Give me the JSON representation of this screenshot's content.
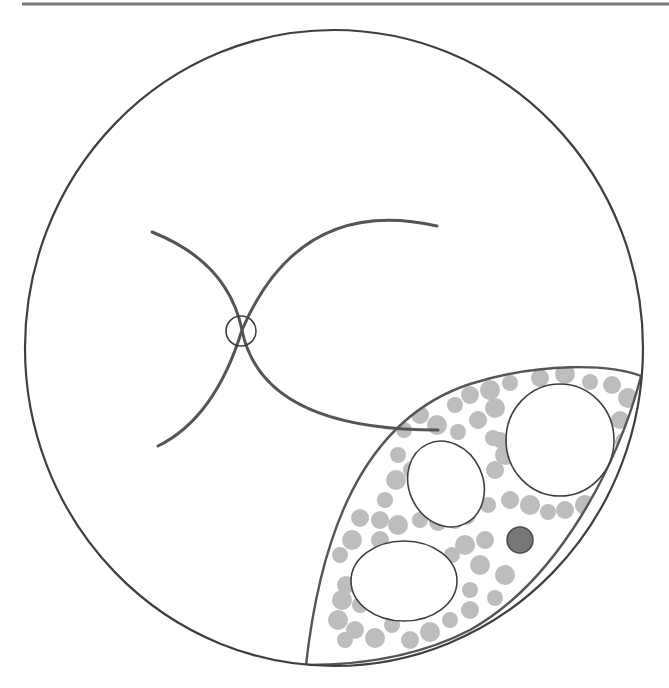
{
  "diagram": {
    "width": 669,
    "height": 688,
    "background": "#ffffff",
    "colors": {
      "stroke": "#555555",
      "thin_stroke": "#3f3f3f",
      "granule": "#bdbdbd",
      "dark_dot_fill": "#777777",
      "dark_dot_stroke": "#4a4a4a",
      "top_rule": "#7a7a7a"
    },
    "top_rule": {
      "x1": 22,
      "y1": 4,
      "x2": 669,
      "y2": 4,
      "width": 3
    },
    "outer_circle": {
      "cx": 334,
      "cy": 348,
      "rx": 309,
      "ry": 318,
      "stroke_width": 2.2
    },
    "crossing_arcs": [
      {
        "name": "arc-left-upper-to-lower-right",
        "d": "M152,232 Q228,262 242,330 Q262,430 438,430"
      },
      {
        "name": "arc-right-upper-to-lower-left",
        "d": "M437,226 Q300,195 242,330 Q215,418 158,446"
      }
    ],
    "crossing_marker": {
      "cx": 241,
      "cy": 331,
      "r": 15
    },
    "lens_region": {
      "d": "M306,665 C320,540 360,420 470,384 C540,362 610,364 641,376 C620,460 560,580 470,630 C420,656 360,665 306,665 Z",
      "outer_clip": true
    },
    "inner_ellipses": [
      {
        "name": "vacuole-large-round",
        "cx": 560,
        "cy": 440,
        "rx": 54,
        "ry": 56,
        "rotate": 0
      },
      {
        "name": "vacuole-oval-middle",
        "cx": 446,
        "cy": 484,
        "rx": 37,
        "ry": 44,
        "rotate": -25
      },
      {
        "name": "vacuole-oval-lower",
        "cx": 404,
        "cy": 581,
        "rx": 53,
        "ry": 40,
        "rotate": 0
      }
    ],
    "dark_dot": {
      "cx": 520,
      "cy": 540,
      "r": 13
    },
    "granules": [
      [
        404,
        430
      ],
      [
        420,
        415
      ],
      [
        437,
        425
      ],
      [
        455,
        405
      ],
      [
        470,
        395
      ],
      [
        490,
        390
      ],
      [
        510,
        383
      ],
      [
        540,
        378
      ],
      [
        565,
        374
      ],
      [
        590,
        382
      ],
      [
        612,
        385
      ],
      [
        628,
        398
      ],
      [
        458,
        432
      ],
      [
        478,
        420
      ],
      [
        495,
        408
      ],
      [
        500,
        440
      ],
      [
        620,
        420
      ],
      [
        625,
        442
      ],
      [
        615,
        465
      ],
      [
        612,
        488
      ],
      [
        600,
        500
      ],
      [
        398,
        455
      ],
      [
        412,
        470
      ],
      [
        396,
        480
      ],
      [
        385,
        500
      ],
      [
        380,
        520
      ],
      [
        398,
        525
      ],
      [
        420,
        520
      ],
      [
        438,
        522
      ],
      [
        466,
        515
      ],
      [
        488,
        505
      ],
      [
        510,
        500
      ],
      [
        530,
        505
      ],
      [
        548,
        512
      ],
      [
        565,
        510
      ],
      [
        585,
        505
      ],
      [
        600,
        515
      ],
      [
        495,
        470
      ],
      [
        505,
        455
      ],
      [
        493,
        438
      ],
      [
        360,
        518
      ],
      [
        352,
        540
      ],
      [
        340,
        555
      ],
      [
        346,
        585
      ],
      [
        342,
        600
      ],
      [
        360,
        605
      ],
      [
        355,
        630
      ],
      [
        375,
        638
      ],
      [
        392,
        625
      ],
      [
        410,
        640
      ],
      [
        430,
        632
      ],
      [
        450,
        620
      ],
      [
        470,
        610
      ],
      [
        480,
        565
      ],
      [
        470,
        590
      ],
      [
        485,
        540
      ],
      [
        465,
        545
      ],
      [
        452,
        555
      ],
      [
        455,
        520
      ],
      [
        505,
        575
      ],
      [
        495,
        598
      ],
      [
        380,
        540
      ],
      [
        338,
        620
      ],
      [
        345,
        640
      ]
    ],
    "granule_r": 9
  }
}
